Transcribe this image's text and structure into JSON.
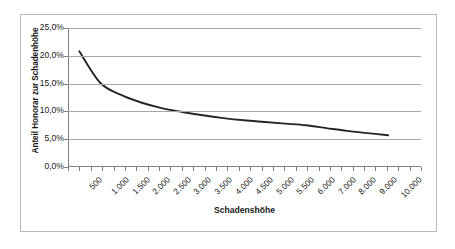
{
  "chart_data": {
    "type": "line",
    "title": "",
    "xlabel": "Schadenshöhe",
    "ylabel": "Anteil Honorar zur Schadenhöhe",
    "ylim": [
      0,
      25
    ],
    "ytick_labels": [
      "25,0%",
      "20,0%",
      "15,0%",
      "10,0%",
      "5,0%",
      "0,0%"
    ],
    "ytick_values": [
      25.0,
      20.0,
      15.0,
      10.0,
      5.0,
      0.0
    ],
    "grid": true,
    "legend": "none",
    "categories": [
      "500",
      "1.000",
      "1.500",
      "2.000",
      "2.500",
      "3.000",
      "3.500",
      "4.000",
      "4.500",
      "5.000",
      "5.500",
      "6.000",
      "7.000",
      "8.000",
      "9.000",
      "10.000"
    ],
    "x": [
      500,
      1000,
      1500,
      2000,
      2500,
      3000,
      3500,
      4000,
      4500,
      5000,
      5500,
      6000,
      7000,
      8000,
      9000,
      10000
    ],
    "values": [
      20.8,
      15.2,
      13.0,
      11.6,
      10.6,
      9.9,
      9.3,
      8.8,
      8.4,
      8.1,
      7.8,
      7.5,
      7.0,
      6.5,
      6.1,
      5.7
    ],
    "series": [
      {
        "name": "Anteil Honorar zur Schadenhöhe",
        "color": "#262626",
        "values": [
          20.8,
          15.2,
          13.0,
          11.6,
          10.6,
          9.9,
          9.3,
          8.8,
          8.4,
          8.1,
          7.8,
          7.5,
          7.0,
          6.5,
          6.1,
          5.7
        ]
      }
    ],
    "tick_count": 31
  },
  "colors": {
    "frame_border": "#b9b9b9",
    "gridline": "#a6a6a6",
    "axis": "#808080",
    "curve": "#262626",
    "text": "#1a1a1a",
    "background": "#ffffff"
  }
}
